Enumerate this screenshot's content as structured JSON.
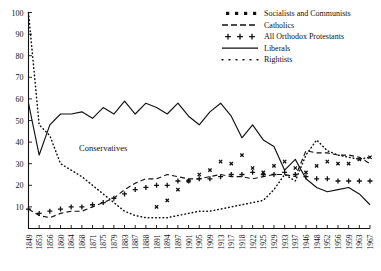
{
  "chart_data": {
    "type": "line",
    "title": "",
    "subtitle": "",
    "xlabel": "",
    "ylabel": "",
    "ylim": [
      0,
      100
    ],
    "ytick_values": [
      10,
      20,
      30,
      40,
      50,
      60,
      70,
      80,
      90,
      100
    ],
    "grid": false,
    "legend_position": "top-right",
    "categories": [
      "1849",
      "1853",
      "1856",
      "1860",
      "1864",
      "1868",
      "1871",
      "1875",
      "1879",
      "1883",
      "1887",
      "1888",
      "1891",
      "1894",
      "1897",
      "1901",
      "1905",
      "1909",
      "1913",
      "1917",
      "1918",
      "1922",
      "1925",
      "1929",
      "1933",
      "1937",
      "1946",
      "1948",
      "1952",
      "1956",
      "1959",
      "1963",
      "1967"
    ],
    "annotations": [
      {
        "text": "Conservatives",
        "x_category": "1875",
        "y_value": 36
      }
    ],
    "series": [
      {
        "name": "Socialists and Communists",
        "marker": "square-dots",
        "style": "dotted-square",
        "values": [
          null,
          null,
          null,
          null,
          null,
          null,
          null,
          null,
          null,
          null,
          null,
          null,
          10,
          13,
          18,
          22,
          25,
          27,
          31,
          30,
          34,
          28,
          26,
          29,
          31,
          28,
          26,
          29,
          31,
          30,
          30,
          32,
          33
        ]
      },
      {
        "name": "Catholics",
        "marker": "dash",
        "style": "dashed",
        "values": [
          9,
          6,
          5,
          7,
          8,
          8,
          10,
          12,
          14,
          18,
          21,
          23,
          23,
          25,
          24,
          23,
          23,
          24,
          25,
          24,
          24,
          23,
          24,
          25,
          25,
          24,
          36,
          35,
          35,
          34,
          34,
          33,
          30
        ]
      },
      {
        "name": "All Orthodox Protestants",
        "marker": "plus",
        "style": "plus-line",
        "values": [
          9,
          7,
          8,
          9,
          10,
          10,
          11,
          12,
          14,
          16,
          18,
          19,
          20,
          20,
          22,
          22,
          23,
          23,
          24,
          25,
          25,
          26,
          25,
          25,
          26,
          25,
          24,
          23,
          23,
          22,
          22,
          22,
          22
        ]
      },
      {
        "name": "Liberals",
        "marker": "none",
        "style": "solid",
        "values": [
          58,
          34,
          48,
          53,
          53,
          54,
          51,
          56,
          53,
          59,
          53,
          58,
          56,
          53,
          58,
          52,
          48,
          54,
          58,
          52,
          42,
          48,
          41,
          38,
          27,
          32,
          23,
          19,
          17,
          18,
          19,
          16,
          11
        ]
      },
      {
        "name": "Rightists",
        "marker": "fine-dots",
        "style": "dotted",
        "values": [
          100,
          48,
          43,
          30,
          27,
          24,
          20,
          16,
          12,
          8,
          6,
          5,
          5,
          5,
          6,
          7,
          8,
          8,
          9,
          10,
          11,
          12,
          13,
          18,
          25,
          22,
          34,
          41,
          36,
          34,
          33,
          32,
          33
        ]
      }
    ]
  },
  "legend": {
    "items": [
      {
        "label": "Socialists and Communists",
        "marker": "square-dots"
      },
      {
        "label": "Catholics",
        "marker": "dash"
      },
      {
        "label": "All Orthodox Protestants",
        "marker": "plus"
      },
      {
        "label": "Liberals",
        "marker": "solid"
      },
      {
        "label": "Rightists",
        "marker": "fine-dots"
      }
    ]
  }
}
